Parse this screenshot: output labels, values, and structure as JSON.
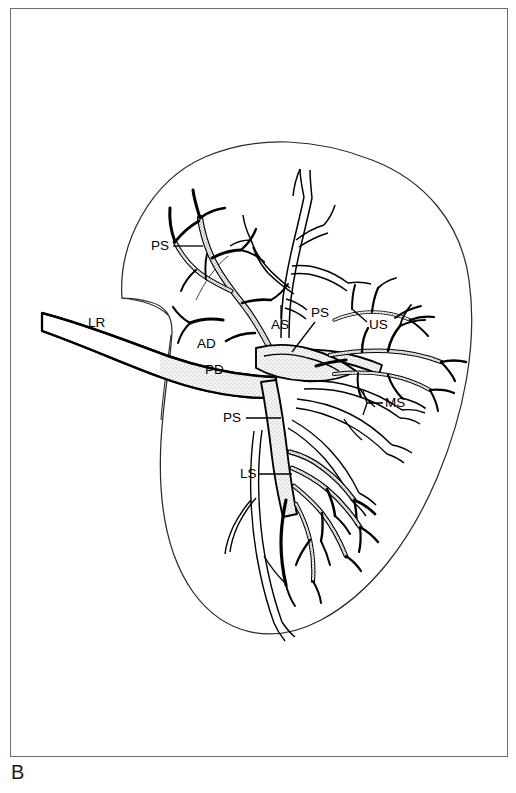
{
  "figure": {
    "panel_letter": "B",
    "type": "anatomical-line-diagram",
    "frame": {
      "stroke_color": "#6e6e6e",
      "background": "#ffffff"
    },
    "ink_color": "#000000",
    "stipple_color": "#8a8a8a"
  },
  "labels": [
    {
      "id": "ps-upper",
      "text": "PS",
      "x": 151,
      "y": 250,
      "leader": {
        "x1": 173,
        "y1": 246,
        "x2": 203,
        "y2": 246
      }
    },
    {
      "id": "lr",
      "text": "LR",
      "x": 88,
      "y": 327,
      "leader": null
    },
    {
      "id": "as",
      "text": "AS",
      "x": 271,
      "y": 329,
      "leader": {
        "x1": 281,
        "y1": 318,
        "x2": 281,
        "y2": 305
      }
    },
    {
      "id": "ps-hilum",
      "text": "PS",
      "x": 311,
      "y": 317,
      "leader": {
        "x1": 315,
        "y1": 322,
        "x2": 290,
        "y2": 352
      }
    },
    {
      "id": "us",
      "text": "US",
      "x": 369,
      "y": 329,
      "leader": {
        "x1": 367,
        "y1": 322,
        "x2": 352,
        "y2": 309
      }
    },
    {
      "id": "ad",
      "text": "AD",
      "x": 197,
      "y": 348,
      "leader": null
    },
    {
      "id": "pd",
      "text": "PD",
      "x": 205,
      "y": 374,
      "leader": null
    },
    {
      "id": "ms",
      "text": "MS",
      "x": 385,
      "y": 407,
      "leader": {
        "x1": 383,
        "y1": 403,
        "x2": 363,
        "y2": 403
      }
    },
    {
      "id": "ps-lower",
      "text": "PS",
      "x": 223,
      "y": 422,
      "leader": {
        "x1": 246,
        "y1": 418,
        "x2": 281,
        "y2": 418
      }
    },
    {
      "id": "ls",
      "text": "LS",
      "x": 240,
      "y": 478,
      "leader": {
        "x1": 259,
        "y1": 474,
        "x2": 290,
        "y2": 474
      }
    }
  ],
  "label_legend": [
    {
      "abbr": "LR",
      "meaning": "main renal trunk (left renal)"
    },
    {
      "abbr": "AD",
      "meaning": "anterior division"
    },
    {
      "abbr": "PD",
      "meaning": "posterior division"
    },
    {
      "abbr": "PS",
      "meaning": "posterior segmental branch"
    },
    {
      "abbr": "AS",
      "meaning": "apical segmental branch"
    },
    {
      "abbr": "US",
      "meaning": "upper segmental branch"
    },
    {
      "abbr": "MS",
      "meaning": "middle segmental branch"
    },
    {
      "abbr": "LS",
      "meaning": "lower segmental branch"
    }
  ]
}
